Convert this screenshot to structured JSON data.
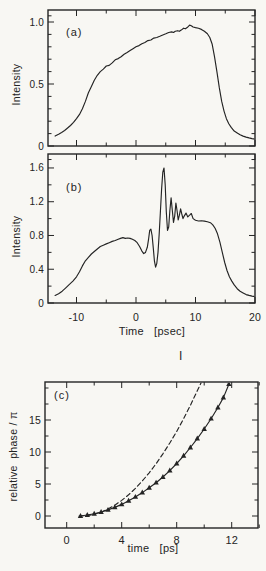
{
  "page": {
    "background": "#f8f7f3",
    "ink": "#242424"
  },
  "figure": {
    "stray_mark": "I"
  },
  "chart_data": [
    {
      "id": "a",
      "type": "line",
      "panel_label": "(a)",
      "ylabel": "Intensity",
      "xlabel": "",
      "xlim": [
        -14.8,
        20
      ],
      "ylim": [
        0,
        1.1
      ],
      "grid": false,
      "xticks": {
        "major": [
          {
            "v": -10,
            "label": ""
          },
          {
            "v": 0,
            "label": ""
          },
          {
            "v": 10,
            "label": ""
          },
          {
            "v": 20,
            "label": ""
          }
        ],
        "minor": [
          -5,
          5,
          15
        ]
      },
      "yticks": {
        "major": [
          {
            "v": 0,
            "label": "0"
          },
          {
            "v": 0.5,
            "label": "0.5"
          },
          {
            "v": 1.0,
            "label": "1.0"
          }
        ],
        "minor": [
          0.1,
          0.2,
          0.3,
          0.4,
          0.6,
          0.7,
          0.8,
          0.9,
          1.05
        ]
      },
      "series": [
        {
          "name": "pulse-intensity-envelope",
          "style": "solid",
          "markers": "none",
          "x": [
            -13.6,
            -13,
            -12.5,
            -12,
            -11.5,
            -11,
            -10.5,
            -10,
            -9.5,
            -9,
            -8.5,
            -8,
            -7.5,
            -7,
            -6.5,
            -6,
            -5.5,
            -5,
            -4.5,
            -4,
            -3.5,
            -3,
            -2.5,
            -2,
            -1.5,
            -1,
            -0.5,
            0,
            0.5,
            1,
            1.5,
            2,
            2.5,
            3,
            3.5,
            4,
            4.5,
            5,
            5.5,
            6,
            6.3,
            6.6,
            7,
            7.3,
            7.6,
            8,
            8.3,
            8.6,
            9,
            9.3,
            9.6,
            10,
            10.5,
            11,
            11.5,
            12,
            12.4,
            12.8,
            13.2,
            13.6,
            14,
            14.4,
            14.8,
            15.2,
            15.6,
            16,
            16.5,
            17,
            17.5,
            18,
            18.5,
            19,
            19.5,
            20
          ],
          "y": [
            0.08,
            0.095,
            0.11,
            0.125,
            0.145,
            0.165,
            0.19,
            0.22,
            0.255,
            0.3,
            0.36,
            0.43,
            0.48,
            0.53,
            0.57,
            0.6,
            0.62,
            0.645,
            0.65,
            0.67,
            0.695,
            0.705,
            0.72,
            0.74,
            0.755,
            0.77,
            0.785,
            0.8,
            0.81,
            0.825,
            0.835,
            0.85,
            0.855,
            0.87,
            0.875,
            0.885,
            0.895,
            0.905,
            0.915,
            0.92,
            0.915,
            0.925,
            0.93,
            0.925,
            0.935,
            0.95,
            0.945,
            0.955,
            0.975,
            0.97,
            0.96,
            0.955,
            0.95,
            0.94,
            0.925,
            0.905,
            0.875,
            0.82,
            0.72,
            0.6,
            0.47,
            0.36,
            0.28,
            0.22,
            0.18,
            0.15,
            0.12,
            0.105,
            0.09,
            0.08,
            0.072,
            0.065,
            0.06,
            0.055
          ]
        }
      ]
    },
    {
      "id": "b",
      "type": "line",
      "panel_label": "(b)",
      "ylabel": "Intensity",
      "xlabel": "Time   [psec]",
      "xlim": [
        -14.8,
        20
      ],
      "ylim": [
        0,
        1.77
      ],
      "grid": false,
      "xticks": {
        "major": [
          {
            "v": -10,
            "label": "-10"
          },
          {
            "v": 0,
            "label": "0"
          },
          {
            "v": 10,
            "label": "10"
          },
          {
            "v": 20,
            "label": "20"
          }
        ],
        "minor": [
          -5,
          5,
          15
        ]
      },
      "yticks": {
        "major": [
          {
            "v": 0,
            "label": "0"
          },
          {
            "v": 0.4,
            "label": "0.4"
          },
          {
            "v": 0.8,
            "label": "0.8"
          },
          {
            "v": 1.2,
            "label": "1.2"
          },
          {
            "v": 1.6,
            "label": "1.6"
          }
        ],
        "minor": [
          0.2,
          0.6,
          1.0,
          1.4,
          1.7
        ]
      },
      "series": [
        {
          "name": "modulated-pulse-intensity",
          "style": "solid",
          "markers": "none",
          "x": [
            -13.6,
            -13,
            -12.4,
            -11.8,
            -11.2,
            -10.6,
            -10,
            -9.5,
            -9,
            -8.5,
            -8,
            -7.5,
            -7,
            -6.5,
            -6,
            -5.5,
            -5,
            -4.5,
            -4,
            -3.5,
            -3,
            -2.6,
            -2.2,
            -1.8,
            -1.4,
            -1,
            -0.6,
            -0.2,
            0.2,
            0.6,
            1,
            1.3,
            1.6,
            1.9,
            2.1,
            2.3,
            2.5,
            2.7,
            2.9,
            3.1,
            3.3,
            3.5,
            3.7,
            3.9,
            4.1,
            4.3,
            4.5,
            4.7,
            4.9,
            5.1,
            5.3,
            5.5,
            5.7,
            5.9,
            6.1,
            6.3,
            6.5,
            6.7,
            6.9,
            7.1,
            7.3,
            7.5,
            7.7,
            7.9,
            8.1,
            8.4,
            8.7,
            9,
            9.3,
            9.6,
            10,
            10.5,
            11,
            11.5,
            12,
            12.5,
            12.9,
            13.3,
            13.7,
            14.1,
            14.5,
            14.9,
            15.3,
            15.7,
            16.1,
            16.5,
            17,
            17.5,
            18,
            18.5,
            19,
            19.5,
            20
          ],
          "y": [
            0.09,
            0.11,
            0.14,
            0.18,
            0.22,
            0.26,
            0.31,
            0.37,
            0.44,
            0.5,
            0.54,
            0.58,
            0.61,
            0.64,
            0.67,
            0.685,
            0.7,
            0.715,
            0.73,
            0.74,
            0.755,
            0.765,
            0.775,
            0.765,
            0.77,
            0.765,
            0.755,
            0.74,
            0.715,
            0.67,
            0.615,
            0.585,
            0.6,
            0.66,
            0.75,
            0.86,
            0.875,
            0.8,
            0.65,
            0.5,
            0.425,
            0.47,
            0.6,
            0.82,
            1.08,
            1.35,
            1.55,
            1.6,
            1.4,
            1.08,
            0.86,
            0.9,
            1.1,
            1.245,
            1.1,
            0.955,
            1.03,
            1.185,
            1.09,
            0.985,
            1.04,
            1.115,
            1.055,
            1.0,
            1.03,
            1.065,
            1.02,
            1.04,
            1.06,
            1.0,
            0.98,
            0.972,
            0.975,
            0.97,
            0.962,
            0.952,
            0.925,
            0.885,
            0.82,
            0.72,
            0.6,
            0.48,
            0.385,
            0.31,
            0.26,
            0.215,
            0.17,
            0.14,
            0.12,
            0.1,
            0.09,
            0.082,
            0.075
          ]
        }
      ]
    },
    {
      "id": "c",
      "type": "line",
      "panel_label": "(c)",
      "ylabel": "relative  phase / π",
      "xlabel": "time   [ps]",
      "xlim": [
        -1.65,
        14
      ],
      "ylim": [
        -1.9,
        20.9
      ],
      "grid": false,
      "xticks": {
        "major": [
          {
            "v": 0,
            "label": "0"
          },
          {
            "v": 4,
            "label": "4"
          },
          {
            "v": 8,
            "label": "8"
          },
          {
            "v": 12,
            "label": "12"
          }
        ],
        "minor": [
          2,
          6,
          10,
          14
        ]
      },
      "yticks": {
        "major": [
          {
            "v": 0,
            "label": "0"
          },
          {
            "v": 5,
            "label": "5"
          },
          {
            "v": 10,
            "label": "10"
          },
          {
            "v": 15,
            "label": "15"
          }
        ],
        "minor": [
          2.5,
          7.5,
          12.5,
          17.5,
          20
        ]
      },
      "series": [
        {
          "name": "theoretical-phase-dashed",
          "style": "dashed",
          "markers": "none",
          "x": [
            0.9,
            1.5,
            2,
            2.5,
            3,
            3.5,
            4,
            4.5,
            5,
            5.5,
            6,
            6.5,
            7,
            7.5,
            8,
            8.5,
            9,
            9.4,
            9.8
          ],
          "y": [
            0,
            0.07,
            0.27,
            0.6,
            1.08,
            1.69,
            2.43,
            3.31,
            4.32,
            5.47,
            6.75,
            8.17,
            9.72,
            11.4,
            13.2,
            15.2,
            17.3,
            19.1,
            20.9
          ]
        },
        {
          "name": "measured-phase-markers",
          "style": "solid",
          "markers": "triangle",
          "x": [
            1,
            1.5,
            2,
            2.5,
            3,
            3.5,
            4,
            4.5,
            5,
            5.5,
            6,
            6.5,
            7,
            7.5,
            8,
            8.5,
            9,
            9.5,
            10,
            10.5,
            11,
            11.4,
            11.8
          ],
          "y": [
            0,
            0.15,
            0.35,
            0.62,
            0.95,
            1.35,
            1.82,
            2.37,
            2.98,
            3.65,
            4.4,
            5.2,
            6.1,
            7.1,
            8.2,
            9.4,
            10.7,
            12.1,
            13.6,
            15.2,
            16.95,
            18.5,
            20.6
          ]
        }
      ]
    }
  ]
}
